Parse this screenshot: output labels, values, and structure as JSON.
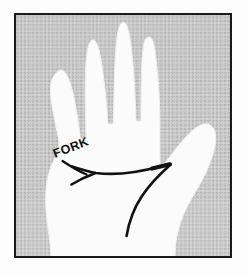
{
  "figure": {
    "kind": "palmistry-hand-diagram",
    "title_text": "",
    "outer_background": "#fdfdfd",
    "frame": {
      "name": "illustration-frame",
      "x": 14,
      "y": 13,
      "width": 218,
      "height": 245,
      "border_color": "#1a1a1a",
      "border_width": 2
    },
    "panel": {
      "background_color": "#c9c9c9",
      "texture": "halftone-stipple",
      "texture_dot_color": "#b0b0b0"
    },
    "hand": {
      "name": "left-hand-palm",
      "fill_color": "#fbfbfb",
      "outline_color": "#e6e6e6",
      "view": "palm",
      "digits": [
        {
          "name": "pinky-finger",
          "tip_x": 57,
          "tip_y": 72
        },
        {
          "name": "ring-finger",
          "tip_x": 88,
          "tip_y": 40
        },
        {
          "name": "middle-finger",
          "tip_x": 119,
          "tip_y": 22
        },
        {
          "name": "index-finger",
          "tip_x": 152,
          "tip_y": 38
        },
        {
          "name": "thumb",
          "tip_x": 211,
          "tip_y": 128
        }
      ]
    },
    "palm_lines": [
      {
        "name": "heart-line",
        "stroke_color": "#111111",
        "stroke_width": 3,
        "start_x": 72,
        "start_y": 166,
        "end_x": 170,
        "end_y": 164,
        "note": "runs across palm and terminates between index and thumb"
      },
      {
        "name": "fork-branch-lower",
        "stroke_color": "#111111",
        "stroke_width": 3,
        "start_x": 72,
        "start_y": 184,
        "end_x": 95,
        "end_y": 173
      },
      {
        "name": "descending-line",
        "stroke_color": "#111111",
        "stroke_width": 3,
        "start_x": 169,
        "start_y": 166,
        "end_x": 126,
        "end_y": 236,
        "note": "curves down from the line terminus toward the wrist"
      }
    ],
    "annotation": {
      "name": "fork-label",
      "text": "FORK",
      "color": "#111111",
      "x": 55,
      "y": 158,
      "rotation_deg": -21,
      "font_size": 12,
      "leader": {
        "name": "fork-leader-line",
        "from_x": 63,
        "from_y": 161,
        "to_x": 86,
        "to_y": 175,
        "color": "#111111"
      }
    }
  }
}
